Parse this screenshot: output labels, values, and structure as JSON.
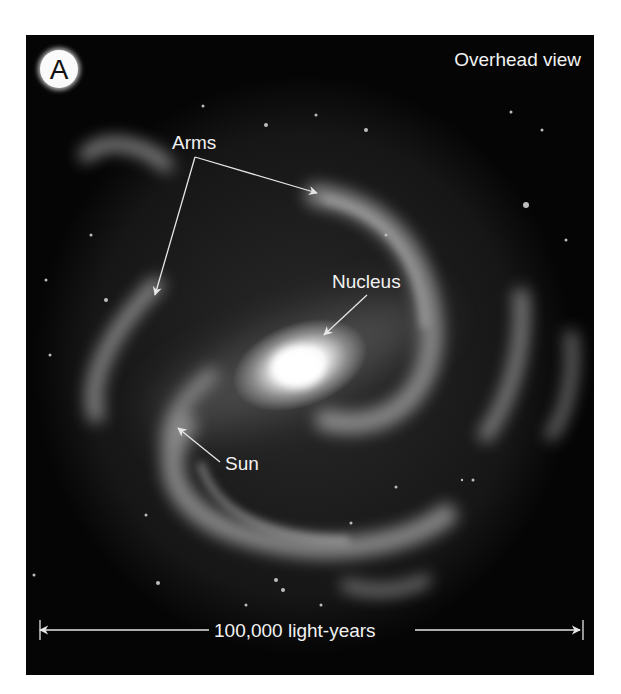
{
  "figure": {
    "panel_letter": "A",
    "title": "Overhead view",
    "labels": {
      "arms": "Arms",
      "nucleus": "Nucleus",
      "sun": "Sun"
    },
    "scale_bar": {
      "text": "100,000 light-years"
    },
    "colors": {
      "background": "#050505",
      "label": "#f2f2f2",
      "arrow": "#e6e6e6"
    }
  }
}
